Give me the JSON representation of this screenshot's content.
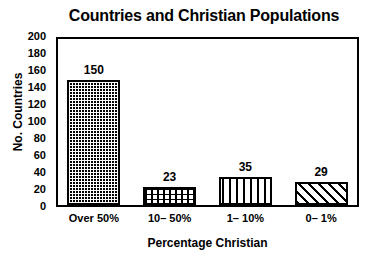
{
  "chart_data": {
    "type": "bar",
    "title": "Countries and Christian Populations",
    "xlabel": "Percentage Christian",
    "ylabel": "No. Countries",
    "categories": [
      "Over 50%",
      "10– 50%",
      "1– 10%",
      "0– 1%"
    ],
    "values": [
      150,
      23,
      35,
      29
    ],
    "value_labels": [
      "150",
      "23",
      "35",
      "29"
    ],
    "series": [
      {
        "name": "No. Countries",
        "values": [
          150,
          23,
          35,
          29
        ]
      }
    ],
    "ylim": [
      0,
      200
    ],
    "ytick_labels": [
      "200",
      "180",
      "160",
      "140",
      "120",
      "100",
      "80",
      "60",
      "40",
      "20",
      "0"
    ],
    "ytick_values": [
      200,
      180,
      160,
      140,
      120,
      100,
      80,
      60,
      40,
      20,
      0
    ],
    "ytick_step": 20,
    "grid": false,
    "legend": false,
    "bar_fills": [
      "dots",
      "grid",
      "vertical",
      "diagonal"
    ],
    "colors": {
      "background": "#ffffff",
      "foreground": "#000000",
      "bar_fill": "#ffffff",
      "bar_outline": "#000000"
    }
  }
}
